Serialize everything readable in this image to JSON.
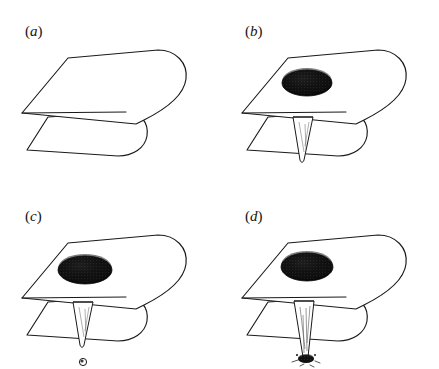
{
  "figure": {
    "background_color": "#ffffff",
    "ink_color": "#1a1a1a",
    "blob_color": "#0d0d0d",
    "stipple_color": "#5a5a5a",
    "width": 439,
    "height": 369,
    "style": "pen-and-ink stippled scientific illustration",
    "panel_grid": {
      "columns": 2,
      "rows": 2
    }
  },
  "panels": [
    {
      "id": "a",
      "label": "(a)",
      "label_text": "a",
      "open_paren": "(",
      "close_paren": ")",
      "label_x": 25,
      "label_y": 36,
      "origin_x": 0,
      "origin_y": 0,
      "caption": "Folded sheet, undisturbed",
      "has_blob": false,
      "has_cone": false,
      "has_droplet": false,
      "has_deposit": false
    },
    {
      "id": "b",
      "label": "(b)",
      "label_text": "b",
      "open_paren": "(",
      "close_paren": ")",
      "label_x": 245,
      "label_y": 36,
      "origin_x": 220,
      "origin_y": 0,
      "caption": "Dark blob on top surface with conical perforation beneath fold",
      "has_blob": true,
      "has_cone": true,
      "has_droplet": false,
      "has_deposit": false,
      "cone_length": 46
    },
    {
      "id": "c",
      "label": "(c)",
      "label_text": "c",
      "open_paren": "(",
      "close_paren": ")",
      "label_x": 25,
      "label_y": 221,
      "origin_x": 0,
      "origin_y": 185,
      "caption": "Blob enlarged, cone formed, small droplet released below",
      "has_blob": true,
      "has_cone": true,
      "has_droplet": true,
      "has_deposit": false,
      "cone_length": 44,
      "droplet_radius": 3.4
    },
    {
      "id": "d",
      "label": "(d)",
      "label_text": "d",
      "open_paren": "(",
      "close_paren": ")",
      "label_x": 245,
      "label_y": 221,
      "origin_x": 220,
      "origin_y": 185,
      "caption": "Elongated cone reaching a dark deposit on the lower surface",
      "has_blob": true,
      "has_cone": true,
      "has_droplet": false,
      "has_deposit": true,
      "cone_length": 62
    }
  ],
  "geometry": {
    "note": "Coordinates are panel-local, in pixels, for a 220x185 panel cell",
    "top_sheet": {
      "back_left_x": 68,
      "back_left_y": 58,
      "back_right_x": 158,
      "back_right_y": 50,
      "right_tip_x": 186,
      "right_tip_y": 78,
      "front_right_x": 136,
      "front_right_y": 124,
      "front_left_x": 22,
      "front_left_y": 113
    },
    "lower_sheet": {
      "left_x": 27,
      "left_y": 150,
      "front_right_x": 118,
      "front_right_y": 156,
      "fold_nose_x": 140,
      "fold_nose_y": 133,
      "top_edge_left_x": 48,
      "top_edge_left_y": 117
    },
    "blob": {
      "center_x": 87,
      "center_y": 83,
      "radius_x": 26,
      "radius_y": 14
    },
    "cone": {
      "mouth_left_x": 74,
      "mouth_left_y": 118,
      "mouth_right_x": 94,
      "mouth_right_y": 118,
      "tip_x": 82,
      "tip_y": 162
    },
    "droplet": {
      "center_x": 82,
      "center_y": 177
    }
  }
}
